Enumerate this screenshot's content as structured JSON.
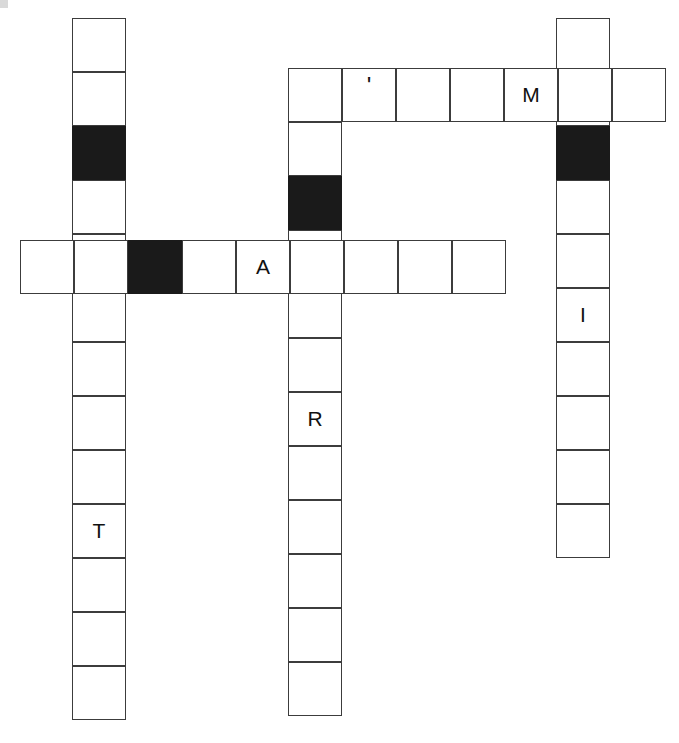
{
  "puzzle": {
    "title": "Crossword Grid",
    "cell_size": 54,
    "colors": {
      "background": "#ffffff",
      "cell_fill": "#ffffff",
      "block_fill": "#1a1a1a",
      "border": "#3c3c3c",
      "letter": "#111111"
    },
    "entries": [
      {
        "name": "down-left",
        "direction": "down",
        "x": 72,
        "y": 18,
        "length": 13,
        "cells": [
          {
            "letter": "",
            "block": false
          },
          {
            "letter": "",
            "block": false
          },
          {
            "letter": "",
            "block": true
          },
          {
            "letter": "",
            "block": false
          },
          {
            "letter": "",
            "block": false
          },
          {
            "letter": "",
            "block": false
          },
          {
            "letter": "",
            "block": false
          },
          {
            "letter": "",
            "block": false
          },
          {
            "letter": "",
            "block": false
          },
          {
            "letter": "T",
            "block": false
          },
          {
            "letter": "",
            "block": false
          },
          {
            "letter": "",
            "block": false
          },
          {
            "letter": "",
            "block": false
          }
        ]
      },
      {
        "name": "down-middle",
        "direction": "down",
        "x": 288,
        "y": 68,
        "length": 12,
        "cells": [
          {
            "letter": "",
            "block": false
          },
          {
            "letter": "",
            "block": false
          },
          {
            "letter": "",
            "block": true
          },
          {
            "letter": "",
            "block": false
          },
          {
            "letter": "",
            "block": false
          },
          {
            "letter": "",
            "block": false
          },
          {
            "letter": "R",
            "block": false
          },
          {
            "letter": "",
            "block": false
          },
          {
            "letter": "",
            "block": false
          },
          {
            "letter": "",
            "block": false
          },
          {
            "letter": "",
            "block": false
          },
          {
            "letter": "",
            "block": false
          }
        ]
      },
      {
        "name": "down-right",
        "direction": "down",
        "x": 556,
        "y": 18,
        "length": 10,
        "cells": [
          {
            "letter": "",
            "block": false
          },
          {
            "letter": "",
            "block": false
          },
          {
            "letter": "",
            "block": true
          },
          {
            "letter": "",
            "block": false
          },
          {
            "letter": "",
            "block": false
          },
          {
            "letter": "I",
            "block": false
          },
          {
            "letter": "",
            "block": false
          },
          {
            "letter": "",
            "block": false
          },
          {
            "letter": "",
            "block": false
          },
          {
            "letter": "",
            "block": false
          }
        ]
      },
      {
        "name": "across-top",
        "direction": "across",
        "x": 288,
        "y": 68,
        "length": 7,
        "cells": [
          {
            "letter": "",
            "block": false
          },
          {
            "letter": "'",
            "block": false
          },
          {
            "letter": "",
            "block": false
          },
          {
            "letter": "",
            "block": false
          },
          {
            "letter": "M",
            "block": false
          },
          {
            "letter": "",
            "block": false
          },
          {
            "letter": "",
            "block": false
          }
        ]
      },
      {
        "name": "across-middle",
        "direction": "across",
        "x": 20,
        "y": 240,
        "length": 9,
        "cells": [
          {
            "letter": "",
            "block": false
          },
          {
            "letter": "",
            "block": false
          },
          {
            "letter": "",
            "block": true
          },
          {
            "letter": "",
            "block": false
          },
          {
            "letter": "A",
            "block": false
          },
          {
            "letter": "",
            "block": false
          },
          {
            "letter": "",
            "block": false
          },
          {
            "letter": "",
            "block": false
          },
          {
            "letter": "",
            "block": false
          }
        ]
      }
    ]
  }
}
